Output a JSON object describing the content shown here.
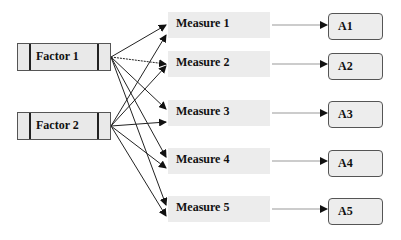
{
  "diagram": {
    "factors": [
      {
        "label": "Factor 1"
      },
      {
        "label": "Factor 2"
      }
    ],
    "measures": [
      {
        "label": "Measure 1"
      },
      {
        "label": "Measure 2"
      },
      {
        "label": "Measure 3"
      },
      {
        "label": "Measure 4"
      },
      {
        "label": "Measure 5"
      }
    ],
    "outcomes": [
      {
        "label": "A1"
      },
      {
        "label": "A2"
      },
      {
        "label": "A3"
      },
      {
        "label": "A4"
      },
      {
        "label": "A5"
      }
    ],
    "edges": [
      {
        "from": "Factor 1",
        "to": "Measure 1"
      },
      {
        "from": "Factor 1",
        "to": "Measure 2"
      },
      {
        "from": "Factor 1",
        "to": "Measure 3"
      },
      {
        "from": "Factor 1",
        "to": "Measure 4"
      },
      {
        "from": "Factor 1",
        "to": "Measure 5"
      },
      {
        "from": "Factor 2",
        "to": "Measure 1"
      },
      {
        "from": "Factor 2",
        "to": "Measure 2"
      },
      {
        "from": "Factor 2",
        "to": "Measure 3"
      },
      {
        "from": "Factor 2",
        "to": "Measure 4"
      },
      {
        "from": "Factor 2",
        "to": "Measure 5"
      },
      {
        "from": "Measure 1",
        "to": "A1"
      },
      {
        "from": "Measure 2",
        "to": "A2"
      },
      {
        "from": "Measure 3",
        "to": "A3"
      },
      {
        "from": "Measure 4",
        "to": "A4"
      },
      {
        "from": "Measure 5",
        "to": "A5"
      }
    ]
  }
}
